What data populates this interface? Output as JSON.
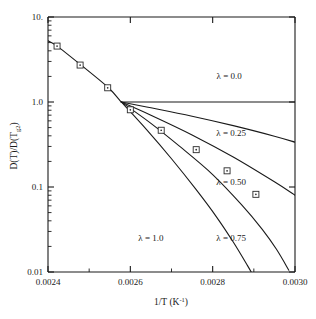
{
  "chart_data": {
    "type": "line",
    "title": "",
    "xlabel": "1/T (K⁻¹)",
    "ylabel": "D(T)/D(T₉₂)",
    "xlabel_parts": {
      "main": "1/T (K",
      "sup": "-1",
      "tail": ")"
    },
    "ylabel_parts": {
      "main": "D(T)/D(T",
      "sub": "g2",
      "tail": ")"
    },
    "xscale": "linear",
    "yscale": "log",
    "xlim": [
      0.0024,
      0.003
    ],
    "ylim": [
      0.01,
      10.0
    ],
    "grid": false,
    "legend_position": "inline-annotations",
    "xticks": [
      0.0024,
      0.0026,
      0.0028,
      0.003
    ],
    "xtick_labels": [
      "0.0024",
      "0.0026",
      "0.0028",
      "0.0030"
    ],
    "yticks": [
      0.01,
      0.1,
      1.0,
      10.0
    ],
    "ytick_labels": [
      "0.01",
      "0.1",
      "1.0",
      "10."
    ],
    "convergence_point": {
      "x": 0.002578,
      "y": 1.0
    },
    "series": [
      {
        "name": "lambda-0.0",
        "label": "λ = 0.0",
        "lambda": 0.0,
        "label_x": 0.00284,
        "label_y": 2.05,
        "points": [
          {
            "x": 0.002578,
            "y": 1.0
          },
          {
            "x": 0.003,
            "y": 1.0
          }
        ]
      },
      {
        "name": "lambda-0.25",
        "label": "λ = 0.25",
        "lambda": 0.25,
        "label_x": 0.002845,
        "label_y": 0.43,
        "points": [
          {
            "x": 0.002578,
            "y": 1.0
          },
          {
            "x": 0.00265,
            "y": 0.855
          },
          {
            "x": 0.00275,
            "y": 0.68
          },
          {
            "x": 0.00285,
            "y": 0.527
          },
          {
            "x": 0.00295,
            "y": 0.396
          },
          {
            "x": 0.003,
            "y": 0.337
          }
        ]
      },
      {
        "name": "lambda-0.50",
        "label": "λ = 0.50",
        "lambda": 0.5,
        "label_x": 0.002845,
        "label_y": 0.115,
        "points": [
          {
            "x": 0.002578,
            "y": 1.0
          },
          {
            "x": 0.00265,
            "y": 0.7
          },
          {
            "x": 0.00275,
            "y": 0.41
          },
          {
            "x": 0.00285,
            "y": 0.225
          },
          {
            "x": 0.00295,
            "y": 0.115
          },
          {
            "x": 0.003,
            "y": 0.08
          }
        ]
      },
      {
        "name": "lambda-0.75",
        "label": "λ = 0.75",
        "lambda": 0.75,
        "label_x": 0.002845,
        "label_y": 0.0255,
        "points": [
          {
            "x": 0.002578,
            "y": 1.0
          },
          {
            "x": 0.00265,
            "y": 0.56
          },
          {
            "x": 0.00272,
            "y": 0.3
          },
          {
            "x": 0.0028,
            "y": 0.14
          },
          {
            "x": 0.00287,
            "y": 0.062
          },
          {
            "x": 0.00292,
            "y": 0.032
          },
          {
            "x": 0.002955,
            "y": 0.0185
          },
          {
            "x": 0.002985,
            "y": 0.0105
          }
        ]
      },
      {
        "name": "lambda-1.0",
        "label": "λ = 1.0",
        "lambda": 1.0,
        "label_x": 0.00265,
        "label_y": 0.0255,
        "points": [
          {
            "x": 0.002578,
            "y": 1.0
          },
          {
            "x": 0.00264,
            "y": 0.47
          },
          {
            "x": 0.0027,
            "y": 0.215
          },
          {
            "x": 0.00276,
            "y": 0.093
          },
          {
            "x": 0.00281,
            "y": 0.044
          },
          {
            "x": 0.00285,
            "y": 0.0225
          },
          {
            "x": 0.002885,
            "y": 0.0118
          },
          {
            "x": 0.002905,
            "y": 0.008
          }
        ]
      }
    ],
    "data_points": {
      "name": "measured-data",
      "marker": "open-square-with-center-dot",
      "values": [
        {
          "x": 0.002422,
          "y": 4.55
        },
        {
          "x": 0.002478,
          "y": 2.72
        },
        {
          "x": 0.002545,
          "y": 1.47
        },
        {
          "x": 0.0026,
          "y": 0.81
        },
        {
          "x": 0.002675,
          "y": 0.465
        },
        {
          "x": 0.00276,
          "y": 0.275
        },
        {
          "x": 0.002835,
          "y": 0.155
        },
        {
          "x": 0.002905,
          "y": 0.082
        }
      ]
    },
    "fit_line": {
      "name": "data-trend-line",
      "points": [
        {
          "x": 0.0024,
          "y": 5.25
        },
        {
          "x": 0.002422,
          "y": 4.55
        },
        {
          "x": 0.002478,
          "y": 2.78
        },
        {
          "x": 0.002545,
          "y": 1.5
        },
        {
          "x": 0.002578,
          "y": 1.0
        }
      ]
    }
  },
  "colors": {
    "axis": "#1a1a1a",
    "curve": "#1a1a1a",
    "marker_edge": "#2a2a2a",
    "marker_fill": "#ffffff",
    "background": "#ffffff"
  }
}
